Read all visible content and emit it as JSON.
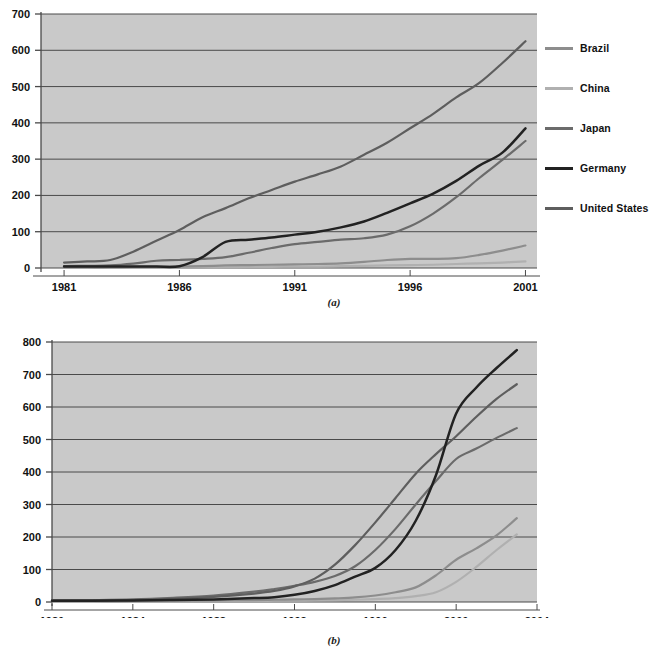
{
  "figure": {
    "subcaption_a": "(a)",
    "subcaption_b": "(b)",
    "background_color": "#ffffff",
    "plot_background_color": "#c9c9c9",
    "gridline_color": "#4a4a4a"
  },
  "legend": {
    "position": "right",
    "entries": [
      {
        "label": "Brazil",
        "color": "#8d8d8d"
      },
      {
        "label": "China",
        "color": "#b0b0b0"
      },
      {
        "label": "Japan",
        "color": "#6b6b6b"
      },
      {
        "label": "Germany",
        "color": "#222222"
      },
      {
        "label": "United States",
        "color": "#5e5e5e"
      }
    ]
  },
  "chart_data": [
    {
      "id": "panel_a",
      "type": "line",
      "title": "",
      "subtitle": "(a)",
      "xlabel": "",
      "ylabel": "",
      "xlim": [
        1980,
        2001.5
      ],
      "ylim": [
        0,
        700
      ],
      "xticks": [
        1981,
        1986,
        1991,
        1996,
        2001
      ],
      "xtick_labels": [
        "1981",
        "1986",
        "1991",
        "1996",
        "2001"
      ],
      "yticks": [
        0,
        100,
        200,
        300,
        400,
        500,
        600,
        700
      ],
      "ytick_labels": [
        "0",
        "100",
        "200",
        "300",
        "400",
        "500",
        "600",
        "700"
      ],
      "grid": true,
      "legend_position": "right",
      "series": [
        {
          "name": "United States",
          "color": "#5e5e5e",
          "x": [
            1981,
            1982,
            1983,
            1984,
            1985,
            1986,
            1987,
            1988,
            1989,
            1990,
            1991,
            1992,
            1993,
            1994,
            1995,
            1996,
            1997,
            1998,
            1999,
            2000,
            2001
          ],
          "values": [
            15,
            18,
            22,
            45,
            75,
            105,
            140,
            165,
            192,
            215,
            238,
            258,
            280,
            312,
            345,
            385,
            425,
            470,
            510,
            565,
            625
          ]
        },
        {
          "name": "Germany",
          "color": "#222222",
          "x": [
            1981,
            1982,
            1983,
            1984,
            1985,
            1986,
            1987,
            1988,
            1989,
            1990,
            1991,
            1992,
            1993,
            1994,
            1995,
            1996,
            1997,
            1998,
            1999,
            2000,
            2001
          ],
          "values": [
            4,
            4,
            4,
            4,
            4,
            5,
            30,
            72,
            78,
            84,
            92,
            100,
            112,
            128,
            152,
            178,
            205,
            240,
            282,
            318,
            385
          ]
        },
        {
          "name": "Japan",
          "color": "#6b6b6b",
          "x": [
            1981,
            1982,
            1983,
            1984,
            1985,
            1986,
            1987,
            1988,
            1989,
            1990,
            1991,
            1992,
            1993,
            1994,
            1995,
            1996,
            1997,
            1998,
            1999,
            2000,
            2001
          ],
          "values": [
            5,
            6,
            7,
            12,
            20,
            22,
            25,
            30,
            42,
            55,
            66,
            72,
            78,
            82,
            92,
            115,
            150,
            195,
            248,
            298,
            350
          ]
        },
        {
          "name": "Brazil",
          "color": "#8d8d8d",
          "x": [
            1981,
            1982,
            1983,
            1984,
            1985,
            1986,
            1987,
            1988,
            1989,
            1990,
            1991,
            1992,
            1993,
            1994,
            1995,
            1996,
            1997,
            1998,
            1999,
            2000,
            2001
          ],
          "values": [
            2,
            2,
            2,
            3,
            3,
            4,
            5,
            7,
            8,
            9,
            10,
            11,
            13,
            17,
            22,
            25,
            25,
            27,
            36,
            48,
            62
          ]
        },
        {
          "name": "China",
          "color": "#b0b0b0",
          "x": [
            1981,
            1982,
            1983,
            1984,
            1985,
            1986,
            1987,
            1988,
            1989,
            1990,
            1991,
            1992,
            1993,
            1994,
            1995,
            1996,
            1997,
            1998,
            1999,
            2000,
            2001
          ],
          "values": [
            1,
            1,
            1,
            1,
            1,
            2,
            2,
            2,
            3,
            3,
            4,
            4,
            5,
            6,
            7,
            8,
            9,
            11,
            13,
            15,
            18
          ]
        }
      ]
    },
    {
      "id": "panel_b",
      "type": "line",
      "title": "",
      "subtitle": "(b)",
      "xlabel": "",
      "ylabel": "",
      "xlim": [
        1980,
        2004
      ],
      "ylim": [
        0,
        800
      ],
      "xticks": [
        1980,
        1984,
        1988,
        1992,
        1996,
        2000,
        2004
      ],
      "xtick_labels": [
        "1980",
        "1984",
        "1988",
        "1992",
        "1996",
        "2000",
        "2004"
      ],
      "yticks": [
        0,
        100,
        200,
        300,
        400,
        500,
        600,
        700,
        800
      ],
      "ytick_labels": [
        "0",
        "100",
        "200",
        "300",
        "400",
        "500",
        "600",
        "700",
        "800"
      ],
      "grid": true,
      "legend_position": "right",
      "series": [
        {
          "name": "Germany",
          "color": "#222222",
          "x": [
            1980,
            1982,
            1984,
            1986,
            1988,
            1990,
            1991,
            1992,
            1993,
            1994,
            1995,
            1996,
            1997,
            1998,
            1999,
            2000,
            2001,
            2002,
            2003
          ],
          "values": [
            4,
            4,
            5,
            6,
            8,
            12,
            15,
            22,
            34,
            52,
            78,
            105,
            160,
            250,
            390,
            580,
            660,
            720,
            775
          ]
        },
        {
          "name": "United States",
          "color": "#5e5e5e",
          "x": [
            1980,
            1982,
            1984,
            1986,
            1988,
            1990,
            1991,
            1992,
            1993,
            1994,
            1995,
            1996,
            1997,
            1998,
            1999,
            2000,
            2001,
            2002,
            2003
          ],
          "values": [
            5,
            5,
            6,
            10,
            16,
            26,
            34,
            48,
            72,
            115,
            175,
            245,
            320,
            395,
            455,
            510,
            570,
            625,
            670
          ]
        },
        {
          "name": "Japan",
          "color": "#6b6b6b",
          "x": [
            1980,
            1982,
            1984,
            1986,
            1988,
            1990,
            1991,
            1992,
            1993,
            1994,
            1995,
            1996,
            1997,
            1998,
            1999,
            2000,
            2001,
            2002,
            2003
          ],
          "values": [
            5,
            6,
            8,
            13,
            20,
            32,
            40,
            50,
            62,
            80,
            110,
            160,
            225,
            300,
            372,
            440,
            472,
            505,
            535
          ]
        },
        {
          "name": "Brazil",
          "color": "#8d8d8d",
          "x": [
            1980,
            1982,
            1984,
            1986,
            1988,
            1990,
            1991,
            1992,
            1993,
            1994,
            1995,
            1996,
            1997,
            1998,
            1999,
            2000,
            2001,
            2002,
            2003
          ],
          "values": [
            3,
            3,
            3,
            4,
            5,
            6,
            7,
            8,
            9,
            11,
            14,
            20,
            30,
            45,
            82,
            130,
            165,
            205,
            258
          ]
        },
        {
          "name": "China",
          "color": "#b0b0b0",
          "x": [
            1980,
            1982,
            1984,
            1986,
            1988,
            1990,
            1991,
            1992,
            1993,
            1994,
            1995,
            1996,
            1997,
            1998,
            1999,
            2000,
            2001,
            2002,
            2003
          ],
          "values": [
            2,
            2,
            2,
            2,
            3,
            3,
            4,
            4,
            5,
            6,
            7,
            9,
            12,
            18,
            30,
            62,
            108,
            160,
            208
          ]
        }
      ]
    }
  ]
}
